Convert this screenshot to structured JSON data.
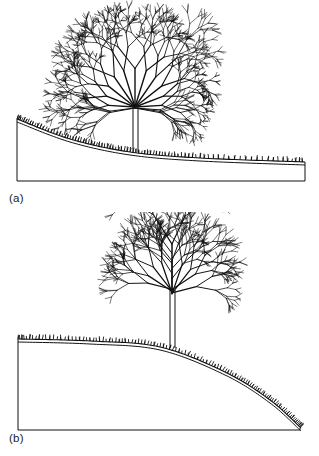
{
  "figure": {
    "domain": "diagram",
    "background_color": "#ffffff",
    "ink_color": "#111111",
    "width": 319,
    "height": 456
  },
  "panels": [
    {
      "id": "panel-a",
      "label": "(a)",
      "label_position": {
        "x": 9,
        "y": 192
      },
      "box": {
        "x": 17,
        "y": 119,
        "width": 288,
        "height": 62
      },
      "terrain": {
        "name": "concave-slope",
        "shape": "concave-decaying",
        "start": {
          "x": 17,
          "y": 119
        },
        "end": {
          "x": 305,
          "y": 162
        },
        "control_points": [
          {
            "x": 17,
            "y": 119
          },
          {
            "x": 70,
            "y": 139
          },
          {
            "x": 130,
            "y": 152
          },
          {
            "x": 200,
            "y": 158
          },
          {
            "x": 305,
            "y": 162
          }
        ],
        "soil_line_offset": 3,
        "grass": {
          "tick_count": 150,
          "tick_height": 4
        }
      },
      "tree": {
        "name": "tree-on-concave-slope",
        "trunk": {
          "x": 133,
          "ground_y": 152,
          "top_y": 107,
          "width": 5
        },
        "crown": {
          "origin": {
            "x": 135,
            "y": 107
          },
          "radius_x": 55,
          "radius_y": 52,
          "top_y": 14,
          "branch_levels": 6,
          "initial_branches": 11,
          "style": "fan-fractal"
        }
      }
    },
    {
      "id": "panel-b",
      "label": "(b)",
      "label_position": {
        "x": 9,
        "y": 432
      },
      "box": {
        "x": 18,
        "y": 339,
        "width": 282,
        "height": 91
      },
      "terrain": {
        "name": "convex-slope",
        "shape": "convex-rounded",
        "start": {
          "x": 18,
          "y": 339
        },
        "end": {
          "x": 301,
          "y": 428
        },
        "control_points": [
          {
            "x": 18,
            "y": 339
          },
          {
            "x": 90,
            "y": 341
          },
          {
            "x": 160,
            "y": 347
          },
          {
            "x": 225,
            "y": 372
          },
          {
            "x": 270,
            "y": 400
          },
          {
            "x": 301,
            "y": 428
          }
        ],
        "soil_line_offset": 3,
        "grass": {
          "tick_count": 150,
          "tick_height": 4
        }
      },
      "tree": {
        "name": "tree-on-convex-slope",
        "trunk": {
          "x": 170,
          "ground_y": 348,
          "top_y": 290,
          "width": 5
        },
        "crown": {
          "origin": {
            "x": 172,
            "y": 290
          },
          "radius_x": 52,
          "radius_y": 58,
          "top_y": 216,
          "branch_levels": 6,
          "initial_branches": 9,
          "style": "upright-fractal"
        }
      }
    }
  ]
}
